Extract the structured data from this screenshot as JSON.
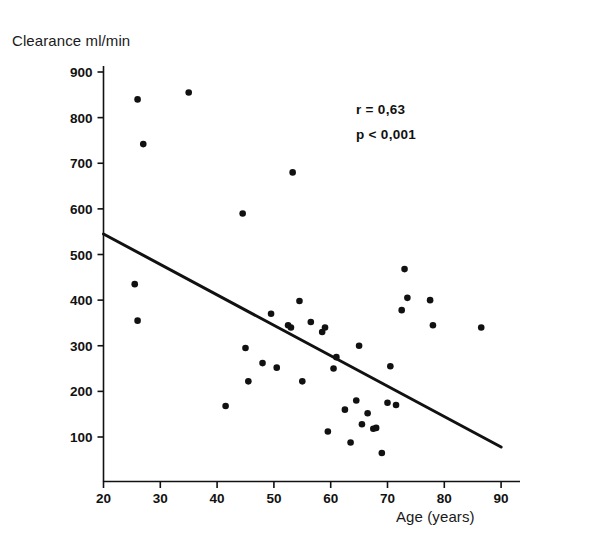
{
  "chart_data": {
    "type": "scatter",
    "title": "",
    "xlabel": "Age (years)",
    "ylabel": "Clearance ml/min",
    "xlim": [
      20,
      90
    ],
    "ylim": [
      0,
      950
    ],
    "xticks": [
      20,
      30,
      40,
      50,
      60,
      70,
      80,
      90
    ],
    "yticks": [
      100,
      200,
      300,
      400,
      500,
      600,
      700,
      800,
      900
    ],
    "grid": false,
    "legend": null,
    "marker_color": "#111111",
    "line_color": "#111111",
    "annotations": [
      {
        "text": "r = 0,63",
        "x": 68,
        "y": 800
      },
      {
        "text": "p < 0,001",
        "x": 68,
        "y": 745
      }
    ],
    "trendline": {
      "name": "regression line",
      "x": [
        20,
        90
      ],
      "y": [
        545,
        78
      ]
    },
    "series": [
      {
        "name": "Clearance vs Age",
        "points": [
          [
            26.0,
            840
          ],
          [
            27.0,
            742
          ],
          [
            35.0,
            855
          ],
          [
            25.5,
            435
          ],
          [
            26.0,
            355
          ],
          [
            41.5,
            168
          ],
          [
            44.5,
            590
          ],
          [
            45.0,
            295
          ],
          [
            45.5,
            222
          ],
          [
            48.0,
            262
          ],
          [
            49.5,
            370
          ],
          [
            50.5,
            252
          ],
          [
            52.5,
            345
          ],
          [
            53.0,
            340
          ],
          [
            53.3,
            680
          ],
          [
            54.5,
            398
          ],
          [
            55.0,
            222
          ],
          [
            56.5,
            352
          ],
          [
            58.5,
            330
          ],
          [
            59.0,
            340
          ],
          [
            59.5,
            112
          ],
          [
            60.5,
            250
          ],
          [
            61.0,
            275
          ],
          [
            62.5,
            160
          ],
          [
            63.5,
            88
          ],
          [
            64.5,
            180
          ],
          [
            65.0,
            300
          ],
          [
            65.5,
            128
          ],
          [
            66.5,
            152
          ],
          [
            67.5,
            118
          ],
          [
            68.0,
            120
          ],
          [
            69.0,
            65
          ],
          [
            70.0,
            175
          ],
          [
            70.5,
            255
          ],
          [
            71.5,
            170
          ],
          [
            72.5,
            378
          ],
          [
            73.0,
            468
          ],
          [
            73.5,
            405
          ],
          [
            77.5,
            400
          ],
          [
            78.0,
            345
          ],
          [
            86.5,
            340
          ]
        ]
      }
    ]
  },
  "axis": {
    "y_title": "Clearance ml/min",
    "x_title": "Age (years)"
  }
}
